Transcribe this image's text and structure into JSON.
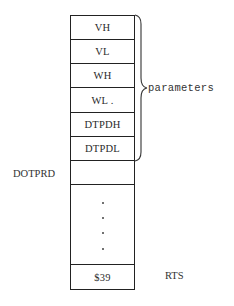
{
  "diagram": {
    "type": "memory-stack",
    "stack": {
      "cells": [
        {
          "label": "VH"
        },
        {
          "label": "VL"
        },
        {
          "label": "WH"
        },
        {
          "label": "WL ."
        },
        {
          "label": "DTPDH"
        },
        {
          "label": "DTPDL"
        },
        {
          "label": ""
        },
        {
          "label": "",
          "continuation": "· · · ·"
        },
        {
          "label": "$39"
        }
      ]
    },
    "brace": {
      "label": "parameters",
      "spans": [
        "VH",
        "VL",
        "WH",
        "WL",
        "DTPDH",
        "DTPDL"
      ]
    },
    "side_labels": {
      "entry": "DOTPRD",
      "return": "RTS"
    }
  }
}
